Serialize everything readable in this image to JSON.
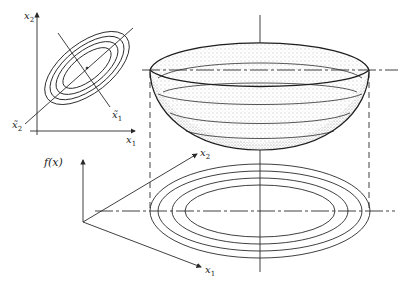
{
  "figure": {
    "colors": {
      "line": "#2a2a2a",
      "stipple": "#7a7a7a",
      "background": "#ffffff"
    }
  },
  "inset": {
    "y_axis_label": "x",
    "y_axis_sub": "2",
    "x_axis_label": "x",
    "x_axis_sub": "1",
    "rot_axis1_label": "x̃",
    "rot_axis1_sub": "1",
    "rot_axis2_label": "x̃",
    "rot_axis2_sub": "2",
    "contour_count": 4
  },
  "main": {
    "f_axis_label": "f(x)",
    "x1_axis_label": "x",
    "x1_axis_sub": "1",
    "x2_axis_label": "x",
    "x2_axis_sub": "2",
    "contour_count": 4,
    "bowl_level_lines": 3
  }
}
